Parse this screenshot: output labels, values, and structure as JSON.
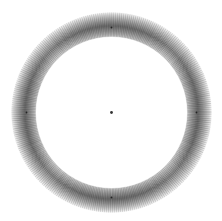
{
  "figure": {
    "center": [
      111.5,
      112.5
    ],
    "outer_radius": 100,
    "inner_radius": 76,
    "dark_radius": 86,
    "ring_color": "#000000",
    "background": "#ffffff",
    "center_dot_color": "#333333",
    "center_dot_radius": 1.4,
    "line_count": 48,
    "cardinal_marks": [
      "top",
      "right",
      "bottom",
      "left"
    ]
  }
}
